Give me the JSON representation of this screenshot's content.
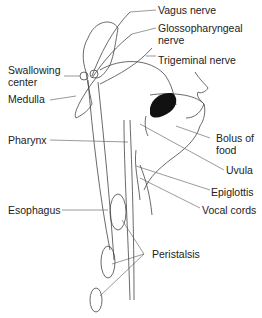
{
  "diagram": {
    "labels": {
      "vagus_nerve": "Vagus nerve",
      "glossopharyngeal_nerve_line1": "Glossopharyngeal",
      "glossopharyngeal_nerve_line2": "nerve",
      "trigeminal_nerve": "Trigeminal nerve",
      "swallowing_center_line1": "Swallowing",
      "swallowing_center_line2": "center",
      "medulla": "Medulla",
      "pharynx": "Pharynx",
      "bolus_line1": "Bolus of",
      "bolus_line2": "food",
      "uvula": "Uvula",
      "epiglottis": "Epiglottis",
      "vocal_cords": "Vocal cords",
      "esophagus": "Esophagus",
      "peristalsis": "Peristalsis"
    },
    "colors": {
      "line": "#444444",
      "bolus": "#111111",
      "text": "#222222",
      "background": "#ffffff"
    }
  }
}
